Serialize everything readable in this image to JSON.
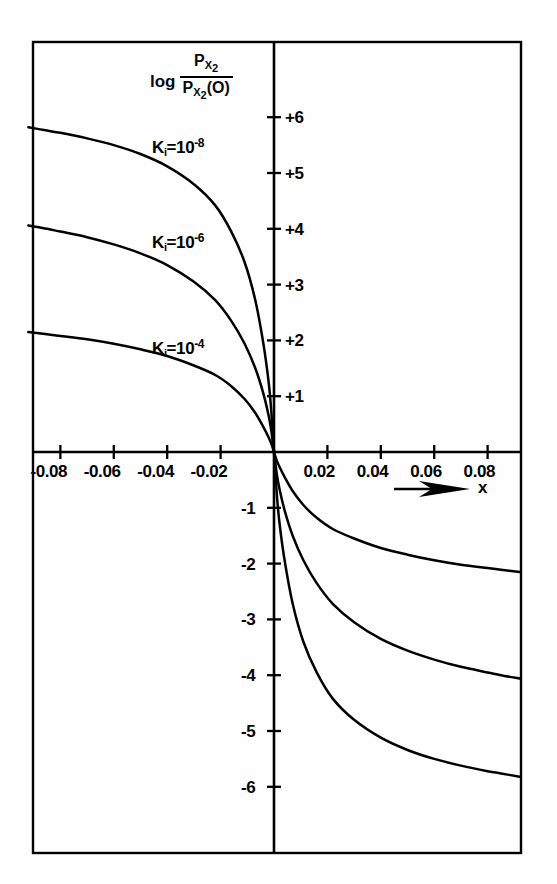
{
  "figure": {
    "background_color": "#fefefe",
    "ink_color": "#000000",
    "frame": {
      "x": 33,
      "y": 42,
      "width": 488,
      "height": 811
    }
  },
  "y_axis_title": {
    "log_word": "log",
    "numerator": "P",
    "numerator_sub": "X",
    "numerator_sub2": "2",
    "denominator": "P",
    "denominator_sub": "X",
    "denominator_sub2": "2",
    "denominator_arg": "(O)"
  },
  "x_axis_name": "x",
  "curve_labels": [
    {
      "name": "K",
      "sub": "i",
      "eq": "=10",
      "exp": "-8"
    },
    {
      "name": "K",
      "sub": "i",
      "eq": "=10",
      "exp": "-6"
    },
    {
      "name": "K",
      "sub": "i",
      "eq": "=10",
      "exp": "-4"
    }
  ],
  "x_tick_labels": [
    "-0.08",
    "-0.06",
    "-0.04",
    "-0.02",
    "0.02",
    "0.04",
    "0.06",
    "0.08"
  ],
  "y_tick_labels_positive": [
    "+6",
    "+5",
    "+4",
    "+3",
    "+2",
    "+1"
  ],
  "y_tick_labels_negative": [
    "-1",
    "-2",
    "-3",
    "-4",
    "-5",
    "-6"
  ],
  "chart_data": {
    "type": "line",
    "title": "",
    "xlabel": "x",
    "ylabel": "log P_X2 / P_X2(O)",
    "xlim": [
      -0.0925,
      0.0925
    ],
    "ylim": [
      -7.2,
      7.2
    ],
    "x_ticks": [
      -0.08,
      -0.06,
      -0.04,
      -0.02,
      0.02,
      0.04,
      0.06,
      0.08
    ],
    "y_ticks": [
      6,
      5,
      4,
      3,
      2,
      1,
      -1,
      -2,
      -3,
      -4,
      -5,
      -6
    ],
    "grid": false,
    "legend": "inline-curve-labels",
    "axes_style": "centered-cross-with-outer-frame",
    "series": [
      {
        "name": "Ki=10^-8",
        "label": "K_i = 10^-8",
        "plateau_positive": 5.8,
        "plateau_negative": -5.8,
        "x": [
          -0.092,
          -0.085,
          -0.08,
          -0.07,
          -0.06,
          -0.05,
          -0.04,
          -0.03,
          -0.022,
          -0.016,
          -0.011,
          -0.007,
          -0.004,
          -0.002,
          -0.001,
          0,
          0.001,
          0.002,
          0.004,
          0.007,
          0.011,
          0.016,
          0.022,
          0.03,
          0.04,
          0.05,
          0.06,
          0.07,
          0.08,
          0.085,
          0.092
        ],
        "y": [
          5.82,
          5.76,
          5.72,
          5.62,
          5.5,
          5.34,
          5.12,
          4.8,
          4.42,
          3.95,
          3.4,
          2.72,
          1.95,
          1.25,
          0.72,
          0,
          -0.72,
          -1.25,
          -1.95,
          -2.72,
          -3.4,
          -3.95,
          -4.42,
          -4.8,
          -5.12,
          -5.34,
          -5.5,
          -5.62,
          -5.72,
          -5.76,
          -5.82
        ]
      },
      {
        "name": "Ki=10^-6",
        "label": "K_i = 10^-6",
        "plateau_positive": 3.9,
        "plateau_negative": -3.9,
        "x": [
          -0.092,
          -0.085,
          -0.08,
          -0.07,
          -0.06,
          -0.05,
          -0.04,
          -0.03,
          -0.022,
          -0.016,
          -0.011,
          -0.007,
          -0.004,
          -0.002,
          -0.001,
          0,
          0.001,
          0.002,
          0.004,
          0.007,
          0.011,
          0.016,
          0.022,
          0.03,
          0.04,
          0.05,
          0.06,
          0.07,
          0.08,
          0.085,
          0.092
        ],
        "y": [
          4.06,
          4.0,
          3.95,
          3.85,
          3.72,
          3.56,
          3.35,
          3.05,
          2.72,
          2.35,
          1.94,
          1.5,
          1.05,
          0.65,
          0.38,
          0,
          -0.38,
          -0.65,
          -1.05,
          -1.5,
          -1.94,
          -2.35,
          -2.72,
          -3.05,
          -3.35,
          -3.56,
          -3.72,
          -3.85,
          -3.95,
          -4.0,
          -4.06
        ]
      },
      {
        "name": "Ki=10^-4",
        "label": "K_i = 10^-4",
        "plateau_positive": 2.0,
        "plateau_negative": -2.0,
        "x": [
          -0.092,
          -0.085,
          -0.08,
          -0.07,
          -0.06,
          -0.05,
          -0.04,
          -0.03,
          -0.022,
          -0.016,
          -0.011,
          -0.007,
          -0.004,
          -0.002,
          -0.001,
          0,
          0.001,
          0.002,
          0.004,
          0.007,
          0.011,
          0.016,
          0.022,
          0.03,
          0.04,
          0.05,
          0.06,
          0.07,
          0.08,
          0.085,
          0.092
        ],
        "y": [
          2.15,
          2.11,
          2.08,
          2.02,
          1.94,
          1.84,
          1.72,
          1.55,
          1.38,
          1.18,
          0.95,
          0.7,
          0.45,
          0.26,
          0.15,
          0,
          -0.15,
          -0.26,
          -0.45,
          -0.7,
          -0.95,
          -1.18,
          -1.38,
          -1.55,
          -1.72,
          -1.84,
          -1.94,
          -2.02,
          -2.08,
          -2.11,
          -2.15
        ]
      }
    ]
  }
}
